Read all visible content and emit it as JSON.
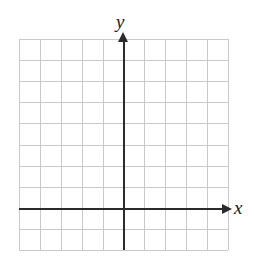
{
  "figure": {
    "type": "blank-cartesian-coordinate-grid",
    "background_color": "#ffffff"
  },
  "grid": {
    "columns": 10,
    "rows": 10,
    "cell_size_px": 21,
    "left_px": 19,
    "top_px": 39,
    "width_px": 209,
    "height_px": 211,
    "line_color": "#c9c9c9"
  },
  "axes": {
    "color": "#2b2b2b",
    "origin": {
      "x_px": 124,
      "y_px": 209
    },
    "x_axis": {
      "label": "x",
      "start_px": 19,
      "end_px": 222,
      "y_px": 209,
      "arrow": "right",
      "label_x_px": 234,
      "label_y_px": 198
    },
    "y_axis": {
      "label": "y",
      "start_px": 250,
      "end_px": 42,
      "x_px": 124,
      "arrow": "up",
      "label_x_px": 116,
      "label_y_px": 12
    }
  },
  "chart_data": {
    "type": "scatter",
    "title": "",
    "xlabel": "x",
    "ylabel": "y",
    "xlim": [
      -5,
      5
    ],
    "ylim": [
      -2,
      8
    ],
    "grid": true,
    "legend": "none",
    "x": [],
    "y": [],
    "series": [],
    "annotations": []
  }
}
